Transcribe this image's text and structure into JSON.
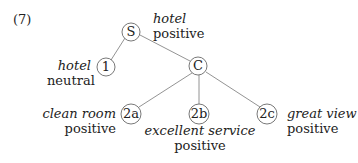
{
  "example_number": "(7)",
  "nodes": {
    "S": {
      "label": "S",
      "aspect": "hotel",
      "sentiment": "positive"
    },
    "n1": {
      "label": "1",
      "aspect": "hotel",
      "sentiment": "neutral"
    },
    "C": {
      "label": "C"
    },
    "n2a": {
      "label": "2a",
      "aspect": "clean room",
      "sentiment": "positive"
    },
    "n2b": {
      "label": "2b",
      "aspect": "excellent service",
      "sentiment": "positive"
    },
    "n2c": {
      "label": "2c",
      "aspect": "great view",
      "sentiment": "positive"
    }
  },
  "edges": [
    [
      "S",
      "1"
    ],
    [
      "S",
      "C"
    ],
    [
      "C",
      "2a"
    ],
    [
      "C",
      "2b"
    ],
    [
      "C",
      "2c"
    ]
  ]
}
